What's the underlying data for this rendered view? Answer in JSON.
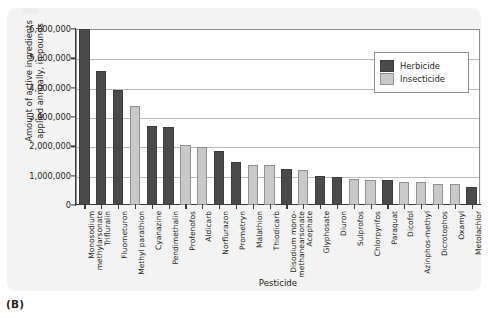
{
  "figure": {
    "panel_letter": "(B)",
    "axis_titles": {
      "y_line1": "Amount of active ingredients",
      "y_line2": "applied annually, in pounds",
      "x": "Pesticide"
    }
  },
  "legend": {
    "position": "top-right-inside",
    "entries": [
      {
        "label": "Herbicide",
        "color": "#4a4a4a",
        "key": "herbicide"
      },
      {
        "label": "Insecticide",
        "color": "#c9c9c9",
        "key": "insecticide"
      }
    ]
  },
  "chart_data": {
    "type": "bar",
    "title": "",
    "xlabel": "Pesticide",
    "ylabel": "Amount of active ingredients applied annually, in pounds",
    "ylim": [
      0,
      6000000
    ],
    "grid": true,
    "ytick_labels": [
      "6,000,000",
      "5,000,000",
      "4,000,000",
      "3,000,000",
      "2,000,000",
      "1,000,000",
      "0"
    ],
    "ytick_values": [
      6000000,
      5000000,
      4000000,
      3000000,
      2000000,
      1000000,
      0
    ],
    "categories": [
      "Monosodium methylarsonate",
      "Trifluralin",
      "Fluometuron",
      "Methyl parathion",
      "Cyanazine",
      "Pendimethalin",
      "Profenofos",
      "Aldicarb",
      "Norflurazon",
      "Prometryn",
      "Malathion",
      "Thiodicarb",
      "Disodium mono-methanearsonate",
      "Acephate",
      "Glyphosate",
      "Diuron",
      "Sulprofos",
      "Chlorpyrifos",
      "Paraquat",
      "Dicofol",
      "Azinphos-methyl",
      "Dicrotophos",
      "Oxamyl",
      "Metolachlor"
    ],
    "category_lines": [
      [
        "Monosodium",
        "methylarsonate"
      ],
      [
        "Trifluralin"
      ],
      [
        "Fluometuron"
      ],
      [
        "Methyl parathion"
      ],
      [
        "Cyanazine"
      ],
      [
        "Pendimethalin"
      ],
      [
        "Profenofos"
      ],
      [
        "Aldicarb"
      ],
      [
        "Norflurazon"
      ],
      [
        "Prometryn"
      ],
      [
        "Malathion"
      ],
      [
        "Thiodicarb"
      ],
      [
        "Disodium mono-",
        "methanearsonate"
      ],
      [
        "Acephate"
      ],
      [
        "Glyphosate"
      ],
      [
        "Diuron"
      ],
      [
        "Sulprofos"
      ],
      [
        "Chlorpyrifos"
      ],
      [
        "Paraquat"
      ],
      [
        "Dicofol"
      ],
      [
        "Azinphos-methyl"
      ],
      [
        "Dicrotophos"
      ],
      [
        "Oxamyl"
      ],
      [
        "Metolachlor"
      ]
    ],
    "values": [
      6000000,
      4580000,
      3920000,
      3380000,
      2700000,
      2660000,
      2060000,
      1990000,
      1840000,
      1450000,
      1380000,
      1350000,
      1230000,
      1200000,
      1000000,
      960000,
      880000,
      860000,
      850000,
      790000,
      780000,
      720000,
      700000,
      600000
    ],
    "types": [
      "herbicide",
      "herbicide",
      "herbicide",
      "insecticide",
      "herbicide",
      "herbicide",
      "insecticide",
      "insecticide",
      "herbicide",
      "herbicide",
      "insecticide",
      "insecticide",
      "herbicide",
      "insecticide",
      "herbicide",
      "herbicide",
      "insecticide",
      "insecticide",
      "herbicide",
      "insecticide",
      "insecticide",
      "insecticide",
      "insecticide",
      "herbicide"
    ]
  }
}
